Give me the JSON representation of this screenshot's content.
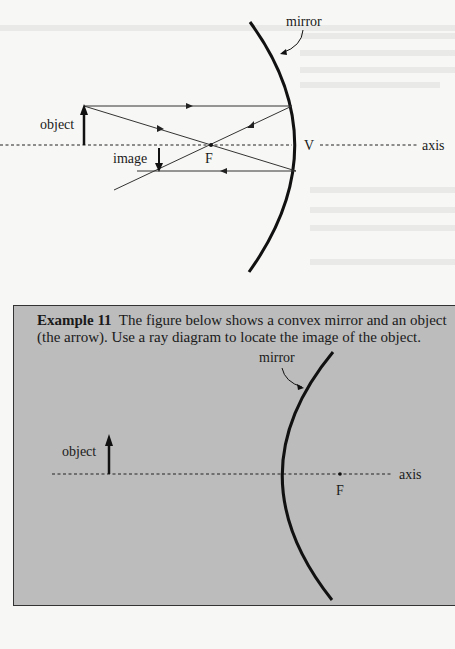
{
  "figure_top": {
    "labels": {
      "mirror": "mirror",
      "object": "object",
      "image": "image",
      "focal_point": "F",
      "vertex": "V",
      "axis": "axis"
    },
    "mirror_type": "concave"
  },
  "example": {
    "title": "Example 11",
    "text_line1": "The figure below shows a convex mirror and an object",
    "text_line2": "(the arrow). Use a ray diagram to locate the image of the object.",
    "background_color": "#bcbcbc"
  },
  "figure_bottom": {
    "labels": {
      "mirror": "mirror",
      "object": "object",
      "focal_point": "F",
      "axis": "axis"
    },
    "mirror_type": "convex"
  }
}
